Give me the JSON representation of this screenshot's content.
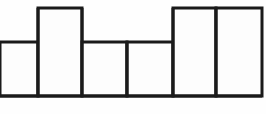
{
  "figure": {
    "title": "Step bar outline",
    "type": "bar-outline-diagram",
    "background_color": "#fefefe",
    "stroke_color": "#1a1a1a",
    "fill_color": "#fdfdfd",
    "stroke_width": 3,
    "canvas": {
      "width": 266,
      "height": 114
    }
  },
  "chart_data": {
    "type": "bar",
    "title": "",
    "subtitle": "",
    "xlabel": "",
    "ylabel": "",
    "categories": [
      "1",
      "2",
      "3",
      "4",
      "5",
      "6"
    ],
    "values": [
      54,
      88,
      54,
      54,
      88,
      88
    ],
    "ylim": [
      0,
      96
    ],
    "xlim": [
      0,
      262
    ],
    "grid": false,
    "legend": null,
    "annotations": [],
    "bars": [
      {
        "index": 0,
        "label": "1",
        "x0": 0,
        "x1": 38,
        "top_y": 42,
        "height": 54,
        "level": "mid",
        "left_edge_drawn": false
      },
      {
        "index": 1,
        "label": "2",
        "x0": 38,
        "x1": 82,
        "top_y": 8,
        "height": 88,
        "level": "tall",
        "left_edge_drawn": true
      },
      {
        "index": 2,
        "label": "3",
        "x0": 82,
        "x1": 127,
        "top_y": 42,
        "height": 54,
        "level": "mid",
        "left_edge_drawn": true
      },
      {
        "index": 3,
        "label": "4",
        "x0": 127,
        "x1": 173,
        "top_y": 42,
        "height": 54,
        "level": "mid",
        "left_edge_drawn": true
      },
      {
        "index": 4,
        "label": "5",
        "x0": 173,
        "x1": 216,
        "top_y": 8,
        "height": 88,
        "level": "tall",
        "left_edge_drawn": true
      },
      {
        "index": 5,
        "label": "6",
        "x0": 216,
        "x1": 262,
        "top_y": 8,
        "height": 88,
        "level": "tall",
        "left_edge_drawn": true
      }
    ],
    "baseline": {
      "y": 96,
      "x_start": 0,
      "x_end": 262
    }
  }
}
